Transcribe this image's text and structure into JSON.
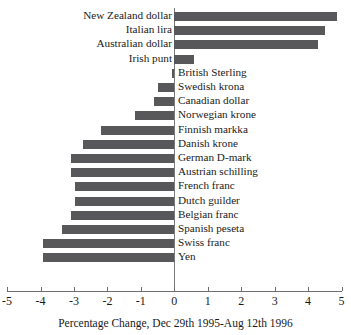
{
  "chart_data": {
    "type": "bar",
    "orientation": "horizontal",
    "title": "",
    "xlabel": "Percentage Change, Dec 29th 1995-Aug 12th 1996",
    "ylabel": "",
    "xlim": [
      -5,
      5
    ],
    "xticks": [
      -5,
      -4,
      -3,
      -2,
      -1,
      0,
      1,
      2,
      3,
      4,
      5
    ],
    "xtick_labels": [
      "-5",
      "-4",
      "-3",
      "-2",
      "-1",
      "0",
      "1",
      "2",
      "3",
      "4",
      "5"
    ],
    "grid": false,
    "legend": null,
    "bar_color": "#58585a",
    "categories": [
      "New Zealand dollar",
      "Italian lira",
      "Australian dollar",
      "Irish punt",
      "British Sterling",
      "Swedish krona",
      "Canadian dollar",
      "Norwegian krone",
      "Finnish markka",
      "Danish krone",
      "German D-mark",
      "Austrian schilling",
      "French franc",
      "Dutch guilder",
      "Belgian franc",
      "Spanish peseta",
      "Swiss franc",
      "Yen"
    ],
    "values": [
      4.85,
      4.5,
      4.3,
      0.6,
      -0.07,
      -0.5,
      -0.6,
      -1.18,
      -2.19,
      -2.72,
      -3.1,
      -3.1,
      -2.97,
      -2.97,
      -3.09,
      -3.35,
      -3.92,
      -3.92
    ]
  },
  "caption": "Percentage Change, Dec 29th 1995-Aug 12th 1996"
}
